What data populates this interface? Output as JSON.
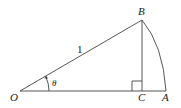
{
  "diagram": {
    "points": {
      "O": {
        "label": "O",
        "x": 20,
        "y": 91
      },
      "C": {
        "label": "C",
        "x": 142,
        "y": 91
      },
      "A": {
        "label": "A",
        "x": 165,
        "y": 91
      },
      "B": {
        "label": "B",
        "x": 142,
        "y": 20
      }
    },
    "segments": [
      "OA",
      "OB",
      "BC"
    ],
    "arc": "BA centered at O",
    "right_angle_at": "C",
    "hypotenuse_label": "1",
    "angle_label": "θ",
    "colors": {
      "stroke": "#444444",
      "text": "#222222",
      "background": "#ffffff"
    }
  }
}
